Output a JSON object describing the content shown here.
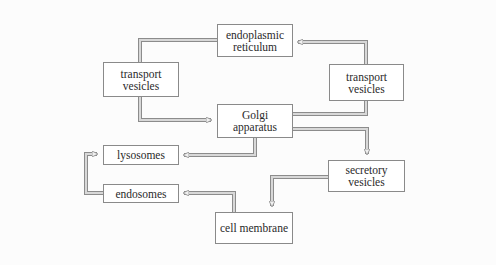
{
  "diagram": {
    "type": "flowchart",
    "title": "",
    "colors": {
      "background": "#fcfcfc",
      "box_border": "#8a8a8a",
      "arrow_fill": "#d8d8d8",
      "arrow_outline": "#8c8c8c",
      "text": "#2a2a2a"
    },
    "nodes": [
      {
        "id": "er",
        "label": "endoplasmic\nreticulum"
      },
      {
        "id": "tv_left",
        "label": "transport\nvesicles"
      },
      {
        "id": "tv_right",
        "label": "transport\nvesicles"
      },
      {
        "id": "golgi",
        "label": "Golgi\napparatus"
      },
      {
        "id": "lysosomes",
        "label": "lysosomes"
      },
      {
        "id": "endosomes",
        "label": "endosomes"
      },
      {
        "id": "secretory",
        "label": "secretory\nvesicles"
      },
      {
        "id": "membrane",
        "label": "cell membrane"
      }
    ],
    "edges": [
      {
        "from": "er",
        "to": "tv_left",
        "via": "line"
      },
      {
        "from": "tv_left",
        "to": "golgi",
        "arrow": true
      },
      {
        "from": "golgi",
        "to": "tv_right",
        "via": "line"
      },
      {
        "from": "tv_right",
        "to": "er",
        "arrow": true
      },
      {
        "from": "golgi",
        "to": "lysosomes",
        "arrow": true
      },
      {
        "from": "golgi",
        "to": "secretory",
        "arrow": true
      },
      {
        "from": "secretory",
        "to": "membrane",
        "arrow": true
      },
      {
        "from": "membrane",
        "to": "endosomes",
        "arrow": true
      },
      {
        "from": "endosomes",
        "to": "lysosomes",
        "arrow": true
      }
    ]
  },
  "labels": {
    "er_line1": "endoplasmic",
    "er_line2": "reticulum",
    "tvl_line1": "transport",
    "tvl_line2": "vesicles",
    "tvr_line1": "transport",
    "tvr_line2": "vesicles",
    "golgi_line1": "Golgi",
    "golgi_line2": "apparatus",
    "lysosomes": "lysosomes",
    "endosomes": "endosomes",
    "sec_line1": "secretory",
    "sec_line2": "vesicles",
    "membrane": "cell membrane"
  }
}
